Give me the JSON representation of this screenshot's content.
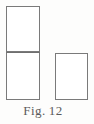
{
  "figure": {
    "caption_label": "Fig.",
    "caption_number": "12",
    "caption_full": "Fig. 12",
    "background_color": "#fdfdfc",
    "stroke_color": "#7a7a7a",
    "fill_color": "#ffffff",
    "shapes": [
      {
        "name": "rect-top-left",
        "type": "rectangle",
        "x": 6,
        "y": 6,
        "width": 34,
        "height": 46
      },
      {
        "name": "rect-bottom-left",
        "type": "rectangle",
        "x": 6,
        "y": 52,
        "width": 34,
        "height": 48
      },
      {
        "name": "rect-right",
        "type": "rectangle",
        "x": 55,
        "y": 53,
        "width": 33,
        "height": 47
      }
    ]
  }
}
